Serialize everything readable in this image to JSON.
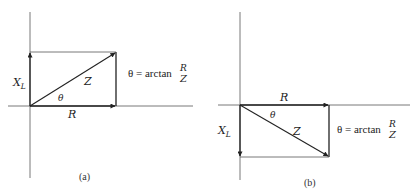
{
  "diagrams": [
    {
      "id": "a",
      "caption": "(a)",
      "labels": {
        "vertical": "X",
        "vertical_sub": "L",
        "horizontal": "R",
        "hypotenuse": "Z",
        "angle": "θ"
      },
      "formula": {
        "lhs": "θ = arctan",
        "num": "R",
        "den": "Z"
      },
      "orientation": "X_L pointing up"
    },
    {
      "id": "b",
      "caption": "(b)",
      "labels": {
        "vertical": "X",
        "vertical_sub": "L",
        "horizontal": "R",
        "hypotenuse": "Z",
        "angle": "θ"
      },
      "formula": {
        "lhs": "θ = arctan",
        "num": "R",
        "den": "Z"
      },
      "orientation": "X_L pointing down"
    }
  ],
  "colors": {
    "line": "#333333",
    "thin": "#555555"
  }
}
